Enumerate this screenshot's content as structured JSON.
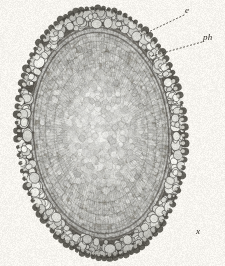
{
  "figure": {
    "kind": "botanical-micrograph-plate",
    "background_color": "#f6f4ef",
    "ink_color": "#2e2a24",
    "specimen": {
      "shape": "oval",
      "center_x": 101,
      "center_y": 133,
      "radius_x": 84,
      "radius_y": 125,
      "rotation_deg": -4,
      "zones": [
        {
          "name": "cortex",
          "label_key": "e",
          "tone": "#6d6a63",
          "outer_scale": 1.0,
          "inner_scale": 0.855,
          "cell_style": "large-rounded-bright-lumen"
        },
        {
          "name": "phloem-endodermis-ring",
          "label_key": "ph",
          "tone": "#5e5b55",
          "outer_scale": 0.855,
          "inner_scale": 0.8,
          "cell_style": "dark-narrow-band"
        },
        {
          "name": "outer-stele",
          "tone": "#8c8981",
          "outer_scale": 0.8,
          "inner_scale": 0.6,
          "cell_style": "radial-files-medium"
        },
        {
          "name": "xylem-core",
          "label_key": "x",
          "tone": "#9a968d",
          "outer_scale": 0.6,
          "inner_scale": 0.0,
          "cell_style": "dense-small-cells"
        }
      ]
    },
    "labels": [
      {
        "id": "e",
        "text": "e",
        "x": 185,
        "y": 6,
        "leader": {
          "from_x": 184,
          "from_y": 15,
          "to_x": 140,
          "to_y": 36,
          "style": "dotted"
        }
      },
      {
        "id": "ph",
        "text": "ph",
        "x": 203,
        "y": 33,
        "leader": {
          "from_x": 202,
          "from_y": 42,
          "to_x": 152,
          "to_y": 56,
          "style": "dotted"
        }
      },
      {
        "id": "x",
        "text": "x",
        "x": 196,
        "y": 227,
        "leader": null
      }
    ]
  }
}
